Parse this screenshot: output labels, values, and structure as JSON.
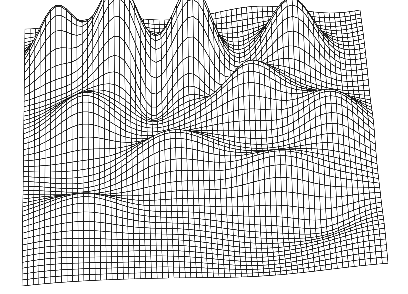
{
  "figure": {
    "kind": "wireframe-surface-plot",
    "title": "",
    "caption": "",
    "background_color": "#ffffff",
    "line_color": "#1a1a1a",
    "line_width": 0.7,
    "hidden_line_removal": true,
    "fill_color": "#ffffff"
  },
  "canvas": {
    "width": 408,
    "height": 294
  },
  "chart_data": {
    "type": "surface",
    "title": "",
    "subtitle": "",
    "xlabel": "",
    "ylabel": "",
    "zlabel": "",
    "grid": true,
    "legend": null,
    "annotations": [],
    "nx": 66,
    "ny": 52,
    "xlim": [
      -3.0,
      3.0
    ],
    "ylim": [
      -3.0,
      3.0
    ],
    "zlim": [
      -0.35,
      1.0
    ],
    "projection": {
      "type": "oblique-parallel",
      "azimuth_deg": 34,
      "elevation_deg": 26,
      "corners_px": {
        "back_left": [
          25,
          22
        ],
        "back_right": [
          360,
          12
        ],
        "front_right": [
          388,
          268
        ],
        "front_left": [
          22,
          282
        ]
      },
      "z_scale_px": 92
    },
    "surface_terms": [
      {
        "kind": "gauss",
        "amp": 0.95,
        "cx": -1.35,
        "cy": 1.65,
        "sx": 0.52,
        "sy": 0.6
      },
      {
        "kind": "gauss",
        "amp": 1.0,
        "cx": -0.05,
        "cy": 1.75,
        "sx": 0.5,
        "sy": 0.58
      },
      {
        "kind": "gauss",
        "amp": 0.72,
        "cx": 1.7,
        "cy": 1.8,
        "sx": 0.58,
        "sy": 0.55
      },
      {
        "kind": "gauss",
        "amp": 0.62,
        "cx": -2.45,
        "cy": 1.95,
        "sx": 0.45,
        "sy": 0.45
      },
      {
        "kind": "gauss",
        "amp": 0.55,
        "cx": 0.85,
        "cy": 0.7,
        "sx": 0.8,
        "sy": 0.55
      },
      {
        "kind": "gauss",
        "amp": 0.48,
        "cx": -1.95,
        "cy": 0.35,
        "sx": 0.7,
        "sy": 0.55
      },
      {
        "kind": "gauss",
        "amp": -0.3,
        "cx": 0.35,
        "cy": 1.05,
        "sx": 0.38,
        "sy": 0.4
      },
      {
        "kind": "gauss",
        "amp": -0.26,
        "cx": -0.8,
        "cy": 1.1,
        "sx": 0.34,
        "sy": 0.38
      },
      {
        "kind": "gauss",
        "amp": 0.42,
        "cx": 2.3,
        "cy": 0.1,
        "sx": 0.7,
        "sy": 0.6
      },
      {
        "kind": "gauss",
        "amp": 0.38,
        "cx": -0.6,
        "cy": -0.55,
        "sx": 0.95,
        "sy": 0.5
      },
      {
        "kind": "gauss",
        "amp": 0.34,
        "cx": 1.3,
        "cy": -1.0,
        "sx": 0.85,
        "sy": 0.45
      },
      {
        "kind": "gauss",
        "amp": 0.26,
        "cx": -1.9,
        "cy": -1.55,
        "sx": 0.8,
        "sy": 0.45
      },
      {
        "kind": "gauss",
        "amp": -0.18,
        "cx": 2.1,
        "cy": -1.7,
        "sx": 0.7,
        "sy": 0.45
      },
      {
        "kind": "ripple",
        "amp": 0.085,
        "kx": 1.15,
        "ky": 1.55,
        "phase": 0.6
      },
      {
        "kind": "ripple",
        "amp": 0.05,
        "kx": 2.3,
        "ky": 0.85,
        "phase": 2.1
      },
      {
        "kind": "tilt",
        "amp": 0.055,
        "kx": 1.0,
        "ky": 0.35,
        "phase": 0.0
      }
    ],
    "x_ticks": [],
    "y_ticks": [],
    "z_ticks": []
  },
  "controls": {
    "visible": false,
    "items": []
  }
}
